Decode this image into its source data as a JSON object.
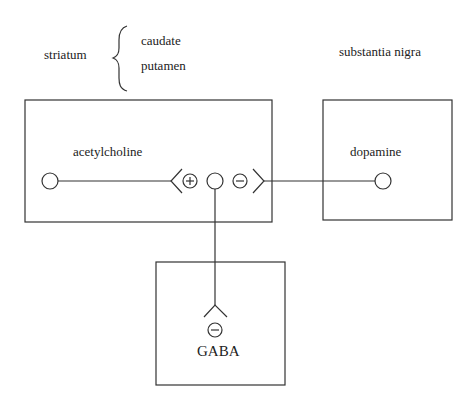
{
  "region_labels": {
    "striatum": "striatum",
    "caudate": "caudate",
    "putamen": "putamen",
    "substantia_nigra": "substantia nigra"
  },
  "nodes": {
    "acetylcholine": {
      "label": "acetylcholine",
      "box": [
        25,
        100,
        247,
        122
      ]
    },
    "dopamine": {
      "label": "dopamine",
      "box": [
        323,
        100,
        129,
        120
      ]
    },
    "gaba": {
      "label": "GABA",
      "box": [
        156,
        262,
        129,
        123
      ]
    }
  },
  "synapse_signs": {
    "acetylcholine_input": "+",
    "dopamine_input": "−",
    "gaba_output": "−"
  },
  "colors": {
    "line": "#333333",
    "background": "#ffffff"
  }
}
